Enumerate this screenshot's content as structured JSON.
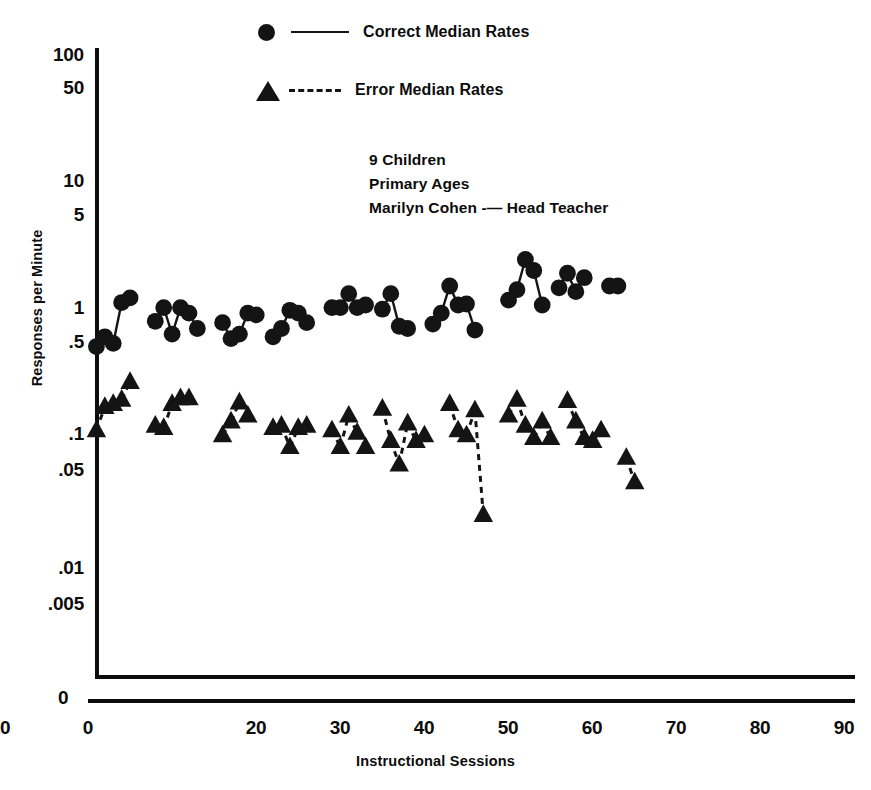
{
  "legend": {
    "correct": {
      "label": "Correct Median Rates",
      "marker": "filled-circle",
      "line": "solid",
      "color": "#141414"
    },
    "error": {
      "label": "Error Median Rates",
      "marker": "filled-triangle",
      "line": "dashed",
      "color": "#141414"
    }
  },
  "annotation": {
    "line1": "9 Children",
    "line2": "Primary Ages",
    "line3": "Marilyn Cohen -— Head Teacher"
  },
  "axes": {
    "y_title": "Responses per Minute",
    "x_title": "Instructional Sessions",
    "zero_label": "0",
    "y_ticks": [
      {
        "label": "100",
        "value": 100
      },
      {
        "label": "50",
        "value": 50
      },
      {
        "label": "10",
        "value": 10
      },
      {
        "label": "5",
        "value": 5
      },
      {
        "label": "1",
        "value": 1
      },
      {
        "label": ".5",
        "value": 0.5
      },
      {
        "label": ".1",
        "value": 0.1
      },
      {
        "label": ".05",
        "value": 0.05
      },
      {
        "label": ".01",
        "value": 0.01
      },
      {
        "label": ".005",
        "value": 0.005
      }
    ],
    "x_ticks": [
      {
        "label": "0",
        "value": 0
      },
      {
        "label": "10",
        "value": 10
      },
      {
        "label": "20",
        "value": 20
      },
      {
        "label": "30",
        "value": 30
      },
      {
        "label": "40",
        "value": 40
      },
      {
        "label": "50",
        "value": 50
      },
      {
        "label": "60",
        "value": 60
      },
      {
        "label": "70",
        "value": 70
      },
      {
        "label": "80",
        "value": 80
      },
      {
        "label": "90",
        "value": 90
      }
    ]
  },
  "chart_data": {
    "type": "scatter",
    "title": "",
    "subtitle": "",
    "xlabel": "Instructional Sessions",
    "ylabel": "Responses per Minute",
    "xlim": [
      0,
      90
    ],
    "ylim": [
      0.005,
      100
    ],
    "yscale": "log",
    "grid": false,
    "legend_position": "top-center",
    "annotations": [
      "9 Children",
      "Primary Ages",
      "Marilyn Cohen -— Head Teacher"
    ],
    "series": [
      {
        "name": "Correct Median Rates",
        "marker": "filled-circle",
        "linestyle": "solid",
        "color": "#141414",
        "points": [
          {
            "x": 1,
            "y": 0.52
          },
          {
            "x": 2,
            "y": 0.62
          },
          {
            "x": 3,
            "y": 0.55
          },
          {
            "x": 4,
            "y": 1.15
          },
          {
            "x": 5,
            "y": 1.25
          },
          {
            "x": 8,
            "y": 0.82
          },
          {
            "x": 9,
            "y": 1.05
          },
          {
            "x": 10,
            "y": 0.65
          },
          {
            "x": 11,
            "y": 1.05
          },
          {
            "x": 12,
            "y": 0.95
          },
          {
            "x": 13,
            "y": 0.72
          },
          {
            "x": 16,
            "y": 0.8
          },
          {
            "x": 17,
            "y": 0.6
          },
          {
            "x": 18,
            "y": 0.65
          },
          {
            "x": 19,
            "y": 0.95
          },
          {
            "x": 20,
            "y": 0.92
          },
          {
            "x": 22,
            "y": 0.62
          },
          {
            "x": 23,
            "y": 0.72
          },
          {
            "x": 24,
            "y": 1.0
          },
          {
            "x": 25,
            "y": 0.95
          },
          {
            "x": 26,
            "y": 0.8
          },
          {
            "x": 29,
            "y": 1.05
          },
          {
            "x": 30,
            "y": 1.05
          },
          {
            "x": 31,
            "y": 1.35
          },
          {
            "x": 32,
            "y": 1.05
          },
          {
            "x": 33,
            "y": 1.1
          },
          {
            "x": 35,
            "y": 1.02
          },
          {
            "x": 36,
            "y": 1.35
          },
          {
            "x": 37,
            "y": 0.75
          },
          {
            "x": 38,
            "y": 0.72
          },
          {
            "x": 41,
            "y": 0.78
          },
          {
            "x": 42,
            "y": 0.95
          },
          {
            "x": 43,
            "y": 1.55
          },
          {
            "x": 44,
            "y": 1.1
          },
          {
            "x": 45,
            "y": 1.12
          },
          {
            "x": 46,
            "y": 0.7
          },
          {
            "x": 50,
            "y": 1.2
          },
          {
            "x": 51,
            "y": 1.45
          },
          {
            "x": 52,
            "y": 2.5
          },
          {
            "x": 53,
            "y": 2.05
          },
          {
            "x": 54,
            "y": 1.1
          },
          {
            "x": 56,
            "y": 1.5
          },
          {
            "x": 57,
            "y": 1.95
          },
          {
            "x": 58,
            "y": 1.4
          },
          {
            "x": 59,
            "y": 1.8
          },
          {
            "x": 62,
            "y": 1.55
          },
          {
            "x": 63,
            "y": 1.55
          }
        ],
        "segments": [
          [
            1,
            2
          ],
          [
            2,
            3
          ],
          [
            3,
            4
          ],
          [
            4,
            5
          ],
          [
            8,
            9
          ],
          [
            9,
            10
          ],
          [
            10,
            11
          ],
          [
            11,
            12
          ],
          [
            12,
            13
          ],
          [
            16,
            17
          ],
          [
            17,
            18
          ],
          [
            18,
            19
          ],
          [
            19,
            20
          ],
          [
            22,
            23
          ],
          [
            23,
            24
          ],
          [
            24,
            25
          ],
          [
            25,
            26
          ],
          [
            29,
            30
          ],
          [
            30,
            31
          ],
          [
            31,
            32
          ],
          [
            32,
            33
          ],
          [
            35,
            36
          ],
          [
            36,
            37
          ],
          [
            37,
            38
          ],
          [
            41,
            42
          ],
          [
            42,
            43
          ],
          [
            43,
            44
          ],
          [
            44,
            45
          ],
          [
            45,
            46
          ],
          [
            50,
            51
          ],
          [
            51,
            52
          ],
          [
            52,
            53
          ],
          [
            53,
            54
          ],
          [
            56,
            57
          ],
          [
            57,
            58
          ],
          [
            58,
            59
          ],
          [
            62,
            63
          ]
        ]
      },
      {
        "name": "Error Median Rates",
        "marker": "filled-triangle",
        "linestyle": "dashed",
        "color": "#141414",
        "points": [
          {
            "x": 1,
            "y": 0.115
          },
          {
            "x": 2,
            "y": 0.175
          },
          {
            "x": 3,
            "y": 0.185
          },
          {
            "x": 4,
            "y": 0.2
          },
          {
            "x": 5,
            "y": 0.275
          },
          {
            "x": 8,
            "y": 0.125
          },
          {
            "x": 9,
            "y": 0.12
          },
          {
            "x": 10,
            "y": 0.185
          },
          {
            "x": 11,
            "y": 0.205
          },
          {
            "x": 12,
            "y": 0.205
          },
          {
            "x": 16,
            "y": 0.105
          },
          {
            "x": 17,
            "y": 0.135
          },
          {
            "x": 18,
            "y": 0.19
          },
          {
            "x": 19,
            "y": 0.15
          },
          {
            "x": 22,
            "y": 0.12
          },
          {
            "x": 23,
            "y": 0.125
          },
          {
            "x": 24,
            "y": 0.085
          },
          {
            "x": 25,
            "y": 0.12
          },
          {
            "x": 26,
            "y": 0.125
          },
          {
            "x": 29,
            "y": 0.115
          },
          {
            "x": 30,
            "y": 0.085
          },
          {
            "x": 31,
            "y": 0.15
          },
          {
            "x": 32,
            "y": 0.11
          },
          {
            "x": 33,
            "y": 0.085
          },
          {
            "x": 35,
            "y": 0.17
          },
          {
            "x": 36,
            "y": 0.095
          },
          {
            "x": 37,
            "y": 0.062
          },
          {
            "x": 38,
            "y": 0.13
          },
          {
            "x": 39,
            "y": 0.095
          },
          {
            "x": 40,
            "y": 0.105
          },
          {
            "x": 43,
            "y": 0.185
          },
          {
            "x": 44,
            "y": 0.115
          },
          {
            "x": 45,
            "y": 0.105
          },
          {
            "x": 46,
            "y": 0.165
          },
          {
            "x": 47,
            "y": 0.025
          },
          {
            "x": 50,
            "y": 0.15
          },
          {
            "x": 51,
            "y": 0.2
          },
          {
            "x": 52,
            "y": 0.125
          },
          {
            "x": 53,
            "y": 0.1
          },
          {
            "x": 54,
            "y": 0.135
          },
          {
            "x": 55,
            "y": 0.1
          },
          {
            "x": 57,
            "y": 0.195
          },
          {
            "x": 58,
            "y": 0.135
          },
          {
            "x": 59,
            "y": 0.1
          },
          {
            "x": 60,
            "y": 0.095
          },
          {
            "x": 61,
            "y": 0.115
          },
          {
            "x": 64,
            "y": 0.07
          },
          {
            "x": 65,
            "y": 0.045
          }
        ],
        "segments": [
          [
            1,
            2
          ],
          [
            2,
            3
          ],
          [
            3,
            4
          ],
          [
            4,
            5
          ],
          [
            8,
            9
          ],
          [
            9,
            10
          ],
          [
            10,
            11
          ],
          [
            11,
            12
          ],
          [
            16,
            17
          ],
          [
            17,
            18
          ],
          [
            18,
            19
          ],
          [
            22,
            23
          ],
          [
            23,
            24
          ],
          [
            24,
            25
          ],
          [
            25,
            26
          ],
          [
            29,
            30
          ],
          [
            30,
            31
          ],
          [
            31,
            32
          ],
          [
            32,
            33
          ],
          [
            35,
            36
          ],
          [
            36,
            37
          ],
          [
            37,
            38
          ],
          [
            38,
            39
          ],
          [
            39,
            40
          ],
          [
            43,
            44
          ],
          [
            44,
            45
          ],
          [
            45,
            46
          ],
          [
            46,
            47
          ],
          [
            50,
            51
          ],
          [
            51,
            52
          ],
          [
            52,
            53
          ],
          [
            53,
            54
          ],
          [
            54,
            55
          ],
          [
            57,
            58
          ],
          [
            58,
            59
          ],
          [
            59,
            60
          ],
          [
            60,
            61
          ],
          [
            64,
            65
          ]
        ]
      }
    ]
  }
}
